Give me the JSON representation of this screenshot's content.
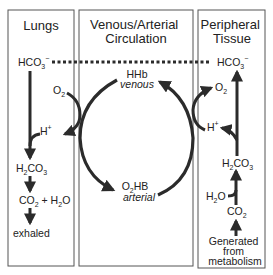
{
  "panels": [
    {
      "id": "lungs",
      "title_lines": [
        "Lungs"
      ]
    },
    {
      "id": "circulation",
      "title_lines": [
        "Venous/Arterial",
        "Circulation"
      ]
    },
    {
      "id": "peripheral",
      "title_lines": [
        "Peripheral",
        "Tissue"
      ]
    }
  ],
  "lungs": {
    "hco3": {
      "base": "HCO",
      "sub": "3",
      "sup": "−"
    },
    "o2": {
      "base": "O",
      "sub": "2"
    },
    "h_plus": {
      "base": "H",
      "sup": "+"
    },
    "h2co3": {
      "a": "H",
      "sub1": "2",
      "b": "CO",
      "sub2": "3"
    },
    "co2_h2o": {
      "a": "CO",
      "sub1": "2",
      "mid": " + H",
      "sub2": "2",
      "b": "O"
    },
    "exhaled": "exhaled"
  },
  "circulation": {
    "top_species": "HHb",
    "top_state": "venous",
    "bottom_species": {
      "a": "O",
      "sub": "2",
      "b": "HB"
    },
    "bottom_state": "arterial"
  },
  "peripheral": {
    "hco3": {
      "base": "HCO",
      "sub": "3",
      "sup": "−"
    },
    "o2": {
      "base": "O",
      "sub": "2"
    },
    "h_plus": {
      "base": "H",
      "sup": "+"
    },
    "h2co3": {
      "a": "H",
      "sub1": "2",
      "b": "CO",
      "sub2": "3"
    },
    "h2o": {
      "a": "H",
      "sub": "2",
      "b": "O"
    },
    "co2": {
      "a": "CO",
      "sub": "2"
    },
    "source_lines": [
      "Generated",
      "from",
      "metabolism"
    ]
  },
  "colors": {
    "stroke": "#2b2b2b",
    "box": "#555555",
    "text": "#222222"
  }
}
